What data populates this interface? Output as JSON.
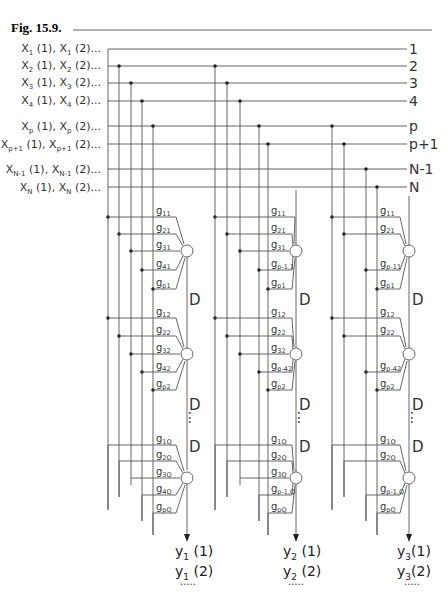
{
  "figure": {
    "title": "Fig.  15.9.",
    "inputs": [
      {
        "base": "X",
        "sub": "1",
        "text1": " (1), ",
        "text2": " (2)...",
        "row": "1"
      },
      {
        "base": "X",
        "sub": "2",
        "text1": " (1), ",
        "text2": " (2)...",
        "row": "2"
      },
      {
        "base": "X",
        "sub": "3",
        "text1": " (1), ",
        "text2": " (2)...",
        "row": "3"
      },
      {
        "base": "X",
        "sub": "4",
        "text1": " (1), ",
        "text2": " (2)...",
        "row": "4"
      },
      {
        "base": "X",
        "sub": "p",
        "text1": " (1), ",
        "text2": " (2)...",
        "row": "p"
      },
      {
        "base": "X",
        "sub": "p+1",
        "text1": " (1), ",
        "text2": " (2)...",
        "row": "p+1"
      },
      {
        "base": "X",
        "sub": "N-1",
        "text1": " (1), ",
        "text2": " (2)...",
        "row": "N-1"
      },
      {
        "base": "X",
        "sub": "N",
        "text1": " (1), ",
        "text2": " (2)...",
        "row": "N"
      }
    ],
    "delay_label": "D",
    "ellipsis": "⋮",
    "outputs": [
      {
        "base": "y",
        "sub": "1",
        "line1": "(1)",
        "line2": "(2)",
        "dots": "....."
      },
      {
        "base": "y",
        "sub": "2",
        "line1": "(1)",
        "line2": "(2)",
        "dots": "....."
      },
      {
        "base": "y",
        "sub": "3",
        "line1": "(1)",
        "line2": "(2)",
        "dots": "....."
      }
    ],
    "weights": {
      "group1": {
        "stage1": [
          "11",
          "21",
          "31",
          "41",
          "p1"
        ],
        "stage2": [
          "12",
          "22",
          "32",
          "42",
          "p2"
        ],
        "stageQ": [
          "1Q",
          "2Q",
          "3Q",
          "4Q",
          "pQ"
        ]
      },
      "group2": {
        "stage1": [
          "11",
          "21",
          "31",
          "p-1,1",
          "p1"
        ],
        "stage2": [
          "12",
          "22",
          "32",
          "p-42",
          "p2"
        ],
        "stageQ": [
          "1Q",
          "2Q",
          "3Q",
          "p-1,Q",
          "pQ"
        ]
      },
      "group3": {
        "stage1": [
          "11",
          "21",
          "p-11",
          "p1"
        ],
        "stage2": [
          "12",
          "22",
          "p-42",
          "p2"
        ],
        "stageQ": [
          "1Q",
          "2Q",
          "p-1,Q",
          "pQ"
        ]
      }
    },
    "weight_base": "g"
  }
}
